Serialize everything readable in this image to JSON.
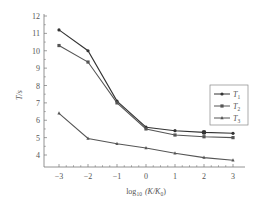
{
  "chart_data": {
    "type": "line",
    "title": "",
    "xlabel": "log10 (K/K0)",
    "xlabel_parts": {
      "main": "log",
      "sub": "10",
      "paren": "(K/K",
      "sub2": "0",
      "close": ")"
    },
    "ylabel": "T/s",
    "x": [
      -3,
      -2,
      -1,
      0,
      1,
      2,
      3
    ],
    "x_ticks": [
      "-3",
      "-2",
      "-1",
      "0",
      "1",
      "2",
      "3"
    ],
    "y_ticks": [
      "4",
      "5",
      "6",
      "7",
      "8",
      "9",
      "10",
      "11",
      "12"
    ],
    "xlim": [
      -3.5,
      3.5
    ],
    "ylim": [
      3.6,
      12
    ],
    "grid": false,
    "legend_position": "upper right",
    "series": [
      {
        "name": "T1",
        "label": "T",
        "sub": "1",
        "marker": "circle",
        "color": "#333333",
        "values": [
          11.2,
          10.0,
          7.1,
          5.6,
          5.4,
          5.3,
          5.25
        ]
      },
      {
        "name": "T2",
        "label": "T",
        "sub": "2",
        "marker": "square",
        "color": "#555555",
        "values": [
          10.3,
          9.35,
          7.0,
          5.5,
          5.15,
          5.05,
          5.0
        ]
      },
      {
        "name": "T3",
        "label": "T",
        "sub": "3",
        "marker": "triangle",
        "color": "#555555",
        "values": [
          6.4,
          4.95,
          4.65,
          4.4,
          4.1,
          3.85,
          3.7
        ]
      }
    ]
  }
}
